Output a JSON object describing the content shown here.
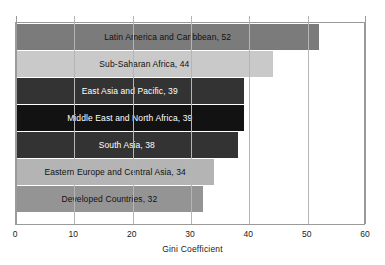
{
  "chart_data": {
    "type": "bar",
    "orientation": "horizontal",
    "title": "",
    "xlabel": "Gini Coefficient",
    "ylabel": "",
    "xlim": [
      0,
      60
    ],
    "xticks": [
      0,
      10,
      20,
      30,
      40,
      50,
      60
    ],
    "xtick_labels": [
      "0",
      "10",
      "20",
      "30",
      "40",
      "50",
      "60"
    ],
    "grid": "vertical",
    "legend": "none",
    "categories": [
      "Latin America and Caribbean",
      "Sub-Saharan Africa",
      "East Asia and Pacific",
      "Middle East and North Africa",
      "South Asia",
      "Eastern Europe and Central Asia",
      "Developed Countries"
    ],
    "values": [
      52,
      44,
      39,
      39,
      38,
      34,
      32
    ],
    "bars": [
      {
        "label": "Latin America and Caribbean, 52",
        "category": "Latin America and Caribbean",
        "value": 52,
        "color": "#7b7b7b",
        "text_color": "#111111"
      },
      {
        "label": "Sub-Saharan Africa, 44",
        "category": "Sub-Saharan Africa",
        "value": 44,
        "color": "#c9c9c9",
        "text_color": "#111111"
      },
      {
        "label": "East Asia and Pacific, 39",
        "category": "East Asia and Pacific",
        "value": 39,
        "color": "#333333",
        "text_color": "#ffffff"
      },
      {
        "label": "Middle East and North Africa, 39",
        "category": "Middle East and North Africa",
        "value": 39,
        "color": "#121212",
        "text_color": "#ffffff"
      },
      {
        "label": "South Asia, 38",
        "category": "South Asia",
        "value": 38,
        "color": "#333333",
        "text_color": "#ffffff"
      },
      {
        "label": "Eastern Europe and Central Asia, 34",
        "category": "Eastern Europe and Central Asia",
        "value": 34,
        "color": "#b4b4b4",
        "text_color": "#111111"
      },
      {
        "label": "Developed Countries, 32",
        "category": "Developed Countries",
        "value": 32,
        "color": "#949494",
        "text_color": "#111111"
      }
    ]
  }
}
